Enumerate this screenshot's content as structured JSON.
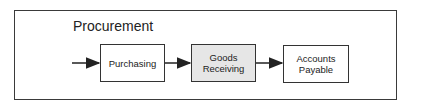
{
  "diagram": {
    "title": "Procurement",
    "steps": [
      {
        "label_line1": "Purchasing",
        "label_line2": "",
        "fill": "#ffffff"
      },
      {
        "label_line1": "Goods",
        "label_line2": "Receiving",
        "fill": "#e6e6e6"
      },
      {
        "label_line1": "Accounts",
        "label_line2": "Payable",
        "fill": "#ffffff"
      }
    ],
    "arrows": [
      {
        "from": "start",
        "to": "Purchasing"
      },
      {
        "from": "Purchasing",
        "to": "Goods Receiving"
      },
      {
        "from": "Goods Receiving",
        "to": "Accounts Payable"
      }
    ]
  }
}
